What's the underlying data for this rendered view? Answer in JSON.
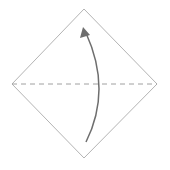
{
  "diagram": {
    "type": "origami-fold-step",
    "colors": {
      "paper_edge": "#b4b4b4",
      "valley_fold_line": "#a0a0a0",
      "arrow": "#6e6e6e",
      "background": "#ffffff"
    },
    "paper": {
      "shape": "square-diamond",
      "vertices": {
        "top": [
          84,
          9
        ],
        "right": [
          157,
          84
        ],
        "bottom": [
          84,
          158
        ],
        "left": [
          12,
          84
        ]
      }
    },
    "fold_line": {
      "style": "dashed",
      "from": [
        12,
        84
      ],
      "to": [
        157,
        84
      ]
    },
    "arrow": {
      "direction": "bottom-to-top",
      "from": [
        86,
        142
      ],
      "to": [
        84,
        28
      ]
    }
  }
}
